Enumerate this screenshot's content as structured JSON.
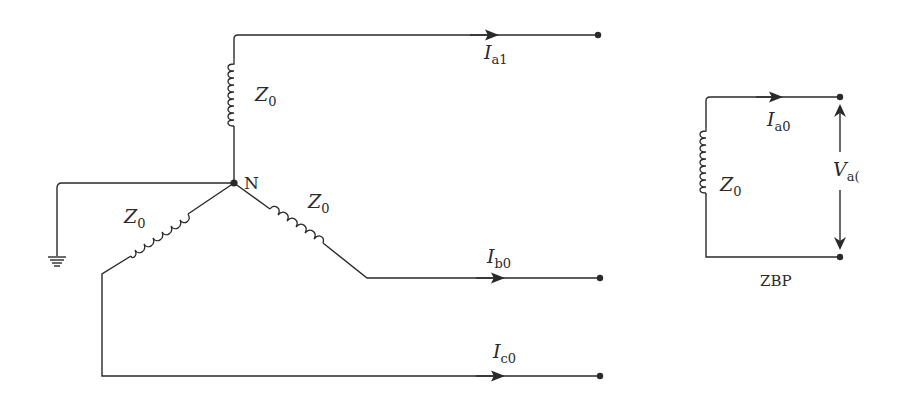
{
  "diagram": {
    "left_circuit": {
      "neutral_label": "N",
      "impedances": [
        {
          "id": "a",
          "symbol": "Z",
          "sub": "0"
        },
        {
          "id": "b",
          "symbol": "Z",
          "sub": "0"
        },
        {
          "id": "c",
          "symbol": "Z",
          "sub": "0"
        }
      ],
      "currents": [
        {
          "id": "a",
          "symbol": "I",
          "sub": "a1"
        },
        {
          "id": "b",
          "symbol": "I",
          "sub": "b0"
        },
        {
          "id": "c",
          "symbol": "I",
          "sub": "c0"
        }
      ],
      "ground": "ground-symbol"
    },
    "right_circuit": {
      "impedance": {
        "symbol": "Z",
        "sub": "0"
      },
      "current": {
        "symbol": "I",
        "sub": "a0"
      },
      "voltage": {
        "symbol": "V",
        "sub": "a("
      },
      "caption": "ZBP"
    },
    "colors": {
      "line": "#2a2a2a",
      "background": "#ffffff"
    }
  }
}
